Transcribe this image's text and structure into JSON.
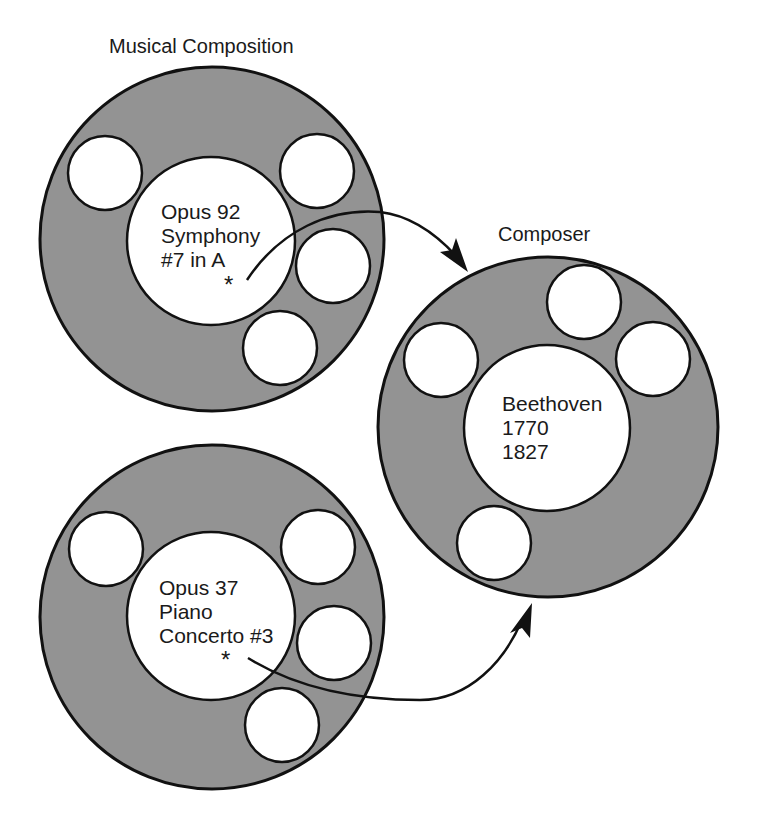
{
  "diagram": {
    "colors": {
      "ring_fill": "#939393",
      "slot_fill": "#ffffff",
      "stroke": "#111111",
      "text": "#1a1a1a"
    },
    "objects": [
      {
        "id": "composition-1",
        "type_label": "Musical Composition",
        "lines": [
          "Opus 92",
          "Symphony",
          "#7 in A"
        ],
        "pointer_marker": "*"
      },
      {
        "id": "composition-2",
        "type_label": "",
        "lines": [
          "Opus 37",
          "Piano",
          "Concerto #3"
        ],
        "pointer_marker": "*"
      },
      {
        "id": "composer",
        "type_label": "Composer",
        "lines": [
          "Beethoven",
          "1770",
          "1827"
        ]
      }
    ],
    "arrows": [
      {
        "from": "composition-1",
        "to": "composer"
      },
      {
        "from": "composition-2",
        "to": "composer"
      }
    ]
  }
}
